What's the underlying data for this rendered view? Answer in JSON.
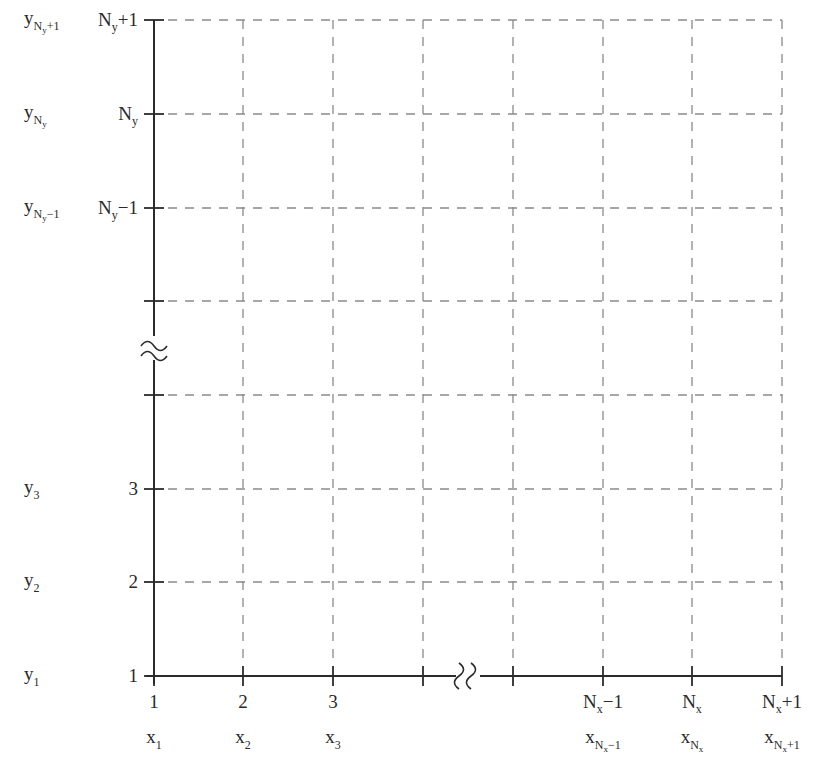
{
  "diagram": {
    "title": "",
    "colors": {
      "axis": "#2b2b2b",
      "grid": "#8a8a8a",
      "text": "#2a2a2a",
      "background": "#ffffff"
    },
    "x_axis": {
      "ticks": [
        {
          "index": "1",
          "index_sub": "",
          "index_suffix": "",
          "coord": "x",
          "coord_sub": "1",
          "coord_subsub": "",
          "coord_subsuffix": ""
        },
        {
          "index": "2",
          "index_sub": "",
          "index_suffix": "",
          "coord": "x",
          "coord_sub": "2",
          "coord_subsub": "",
          "coord_subsuffix": ""
        },
        {
          "index": "3",
          "index_sub": "",
          "index_suffix": "",
          "coord": "x",
          "coord_sub": "3",
          "coord_subsub": "",
          "coord_subsuffix": ""
        },
        {
          "index": "",
          "index_sub": "",
          "index_suffix": "",
          "coord": "",
          "coord_sub": "",
          "coord_subsub": "",
          "coord_subsuffix": ""
        },
        {
          "index": "",
          "index_sub": "",
          "index_suffix": "",
          "coord": "",
          "coord_sub": "",
          "coord_subsub": "",
          "coord_subsuffix": ""
        },
        {
          "index": "N",
          "index_sub": "x",
          "index_suffix": "−1",
          "coord": "x",
          "coord_sub": "N",
          "coord_subsub": "x",
          "coord_subsuffix": "−1"
        },
        {
          "index": "N",
          "index_sub": "x",
          "index_suffix": "",
          "coord": "x",
          "coord_sub": "N",
          "coord_subsub": "x",
          "coord_subsuffix": ""
        },
        {
          "index": "N",
          "index_sub": "x",
          "index_suffix": "+1",
          "coord": "x",
          "coord_sub": "N",
          "coord_subsub": "x",
          "coord_subsuffix": "+1"
        }
      ],
      "break_symbol": "≈",
      "break_between": [
        3,
        4
      ]
    },
    "y_axis": {
      "ticks": [
        {
          "index": "1",
          "index_sub": "",
          "index_suffix": "",
          "coord": "y",
          "coord_sub": "1",
          "coord_subsub": "",
          "coord_subsuffix": ""
        },
        {
          "index": "2",
          "index_sub": "",
          "index_suffix": "",
          "coord": "y",
          "coord_sub": "2",
          "coord_subsub": "",
          "coord_subsuffix": ""
        },
        {
          "index": "3",
          "index_sub": "",
          "index_suffix": "",
          "coord": "y",
          "coord_sub": "3",
          "coord_subsub": "",
          "coord_subsuffix": ""
        },
        {
          "index": "",
          "index_sub": "",
          "index_suffix": "",
          "coord": "",
          "coord_sub": "",
          "coord_subsub": "",
          "coord_subsuffix": ""
        },
        {
          "index": "",
          "index_sub": "",
          "index_suffix": "",
          "coord": "",
          "coord_sub": "",
          "coord_subsub": "",
          "coord_subsuffix": ""
        },
        {
          "index": "N",
          "index_sub": "y",
          "index_suffix": "−1",
          "coord": "y",
          "coord_sub": "N",
          "coord_subsub": "y",
          "coord_subsuffix": "−1"
        },
        {
          "index": "N",
          "index_sub": "y",
          "index_suffix": "",
          "coord": "y",
          "coord_sub": "N",
          "coord_subsub": "y",
          "coord_subsuffix": ""
        },
        {
          "index": "N",
          "index_sub": "y",
          "index_suffix": "+1",
          "coord": "y",
          "coord_sub": "N",
          "coord_subsub": "y",
          "coord_subsuffix": "+1"
        }
      ],
      "break_symbol": "≈",
      "break_between": [
        3,
        4
      ]
    }
  }
}
